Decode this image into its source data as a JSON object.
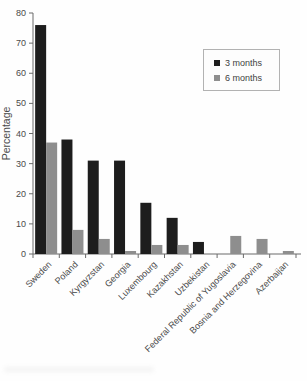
{
  "chart_data": {
    "type": "bar",
    "title": "",
    "xlabel": "",
    "ylabel": "Percentage",
    "ylim": [
      0,
      80
    ],
    "yticks": [
      0,
      10,
      20,
      30,
      40,
      50,
      60,
      70,
      80
    ],
    "grid": false,
    "legend_position": "upper right",
    "categories": [
      "Sweden",
      "Poland",
      "Kyrgyzstan",
      "Georgia",
      "Luxembourg",
      "Kazakhstan",
      "Uzbekistan",
      "Federal Republic of Yugoslavia",
      "Bosnia and Herzegovina",
      "Azerbaijan"
    ],
    "series": [
      {
        "name": "3 months",
        "color": "#1d1d1d",
        "values": [
          76,
          38,
          31,
          31,
          17,
          12,
          4,
          0,
          0,
          0
        ]
      },
      {
        "name": "6 months",
        "color": "#8e8e8e",
        "values": [
          37,
          8,
          5,
          1,
          3,
          3,
          0,
          6,
          5,
          1
        ]
      }
    ]
  },
  "colors": {
    "axis": "#6a6a6a",
    "tick_text": "#4a4a4a",
    "background": "#fefefe",
    "legend_border": "#b2b2b2"
  }
}
